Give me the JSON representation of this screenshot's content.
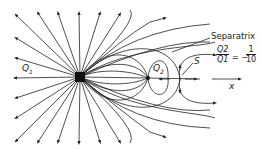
{
  "diagram": {
    "labels": {
      "q1": "Q",
      "q1_sub": "1",
      "q2": "Q",
      "q2_sub": "2",
      "separatrix": "Separatrix",
      "stagnation": "S",
      "axis": "x",
      "ratio_num": "Q2",
      "ratio_den": "Q1",
      "ratio_eq": "= −",
      "ratio_value_num": "1",
      "ratio_value_den": "10"
    },
    "nodes": [
      {
        "id": "source",
        "label": "Q1",
        "x": 80,
        "y": 77
      },
      {
        "id": "sink",
        "label": "Q2",
        "x": 148,
        "y": 78
      },
      {
        "id": "stagnation",
        "label": "S",
        "x": 180,
        "y": 79
      }
    ],
    "colors": {
      "line": "#222222",
      "background": "#ffffff"
    }
  }
}
